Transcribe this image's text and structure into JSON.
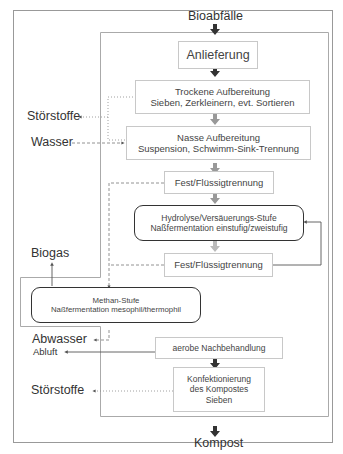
{
  "diagram": {
    "type": "process-flow",
    "language": "de",
    "input_label": "Bioabfälle",
    "output_label": "Kompost",
    "steps": [
      {
        "id": "anlieferung",
        "lines": [
          "Anlieferung"
        ]
      },
      {
        "id": "trockene",
        "lines": [
          "Trockene Aufbereitung",
          "Sieben, Zerkleinern, evt. Sortieren"
        ]
      },
      {
        "id": "nasse",
        "lines": [
          "Nasse Aufbereitung",
          "Suspension, Schwimm-Sink-Trennung"
        ]
      },
      {
        "id": "fest1",
        "lines": [
          "Fest/Flüssigtrennung"
        ]
      },
      {
        "id": "hydrolyse",
        "lines": [
          "Hydrolyse/Versäuerungs-Stufe",
          "Naßfermentation einstufig/zweistufig"
        ],
        "emphasis": true
      },
      {
        "id": "fest2",
        "lines": [
          "Fest/Flüssigtrennung"
        ]
      },
      {
        "id": "methan",
        "lines": [
          "Methan-Stufe",
          "Naßfermentation mesophil/thermophil"
        ],
        "emphasis": true
      },
      {
        "id": "aerobe",
        "lines": [
          "aerobe Nachbehandlung"
        ]
      },
      {
        "id": "konfektionierung",
        "lines": [
          "Konfektionierung",
          "des Kompostes",
          "Sieben"
        ]
      }
    ],
    "side_labels": {
      "stoerstoffe_top": "Störstoffe",
      "wasser": "Wasser",
      "biogas": "Biogas",
      "abwasser": "Abwasser",
      "abluft": "Abluft",
      "stoerstoffe_bottom": "Störstoffe"
    },
    "edges": [
      {
        "from": "Bioabfälle",
        "to": "anlieferung",
        "style": "solid"
      },
      {
        "from": "anlieferung",
        "to": "trockene",
        "style": "solid"
      },
      {
        "from": "trockene",
        "to": "nasse",
        "style": "solid"
      },
      {
        "from": "trockene",
        "to": "Störstoffe",
        "style": "dotted"
      },
      {
        "from": "nasse",
        "to": "Störstoffe",
        "style": "dotted"
      },
      {
        "from": "Wasser",
        "to": "nasse",
        "style": "dashed"
      },
      {
        "from": "nasse",
        "to": "fest1",
        "style": "solid"
      },
      {
        "from": "fest1",
        "to": "hydrolyse",
        "style": "solid"
      },
      {
        "from": "fest1",
        "to": "methan",
        "style": "dashed"
      },
      {
        "from": "hydrolyse",
        "to": "fest2",
        "style": "solid"
      },
      {
        "from": "fest2",
        "to": "hydrolyse",
        "style": "solid",
        "note": "recirculation loop"
      },
      {
        "from": "fest2",
        "to": "methan",
        "style": "dashed"
      },
      {
        "from": "methan",
        "to": "Biogas",
        "style": "solid"
      },
      {
        "from": "methan",
        "to": "Abwasser",
        "style": "dashed"
      },
      {
        "from": "aerobe",
        "to": "Abluft",
        "style": "solid"
      },
      {
        "from": "aerobe",
        "to": "konfektionierung",
        "style": "solid"
      },
      {
        "from": "konfektionierung",
        "to": "Störstoffe",
        "style": "dotted"
      },
      {
        "from": "konfektionierung",
        "to": "Kompost",
        "style": "solid"
      }
    ]
  }
}
